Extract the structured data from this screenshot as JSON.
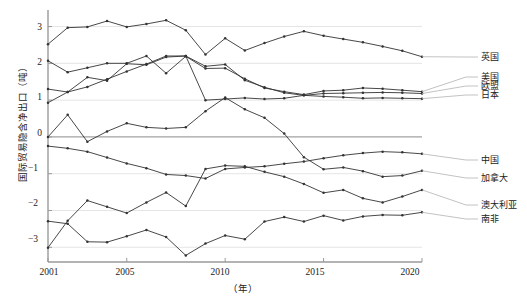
{
  "chart_data": {
    "type": "line",
    "title": "",
    "xlabel": "（年）",
    "ylabel": "国际贸易隐含净出口（吨）",
    "xlim": [
      2001,
      2020
    ],
    "ylim": [
      -3.4,
      3.45
    ],
    "yticks": [
      3,
      2,
      1,
      0,
      -1,
      -2,
      -3
    ],
    "yticklabels": [
      "3",
      "2",
      "1",
      "0",
      "−1",
      "−2",
      "−3"
    ],
    "xticks": [
      2001,
      2005,
      2010,
      2015,
      2020
    ],
    "xticklabels": [
      "2001",
      "2005",
      "2010",
      "2015",
      "2020"
    ],
    "grid": "horizontal",
    "legend_position": "right",
    "x": [
      2001,
      2002,
      2003,
      2004,
      2005,
      2006,
      2007,
      2008,
      2009,
      2010,
      2011,
      2012,
      2013,
      2014,
      2015,
      2016,
      2017,
      2018,
      2019,
      2020
    ],
    "series": [
      {
        "name": "英国",
        "color": "#333333",
        "values": [
          2.52,
          2.97,
          2.99,
          3.15,
          2.99,
          3.07,
          3.17,
          2.9,
          2.24,
          2.68,
          2.35,
          2.55,
          2.73,
          2.87,
          2.75,
          2.66,
          2.57,
          2.46,
          2.34,
          2.18
        ]
      },
      {
        "name": "美国",
        "color": "#333333",
        "values": [
          2.07,
          1.76,
          1.88,
          2.0,
          2.0,
          2.2,
          1.73,
          2.19,
          1.86,
          1.87,
          1.58,
          1.33,
          1.23,
          1.15,
          1.25,
          1.27,
          1.33,
          1.31,
          1.27,
          1.23
        ]
      },
      {
        "name": "欧盟",
        "color": "#333333",
        "values": [
          1.3,
          1.22,
          1.62,
          1.53,
          1.99,
          1.96,
          2.17,
          2.2,
          1.92,
          1.97,
          1.54,
          1.35,
          1.2,
          1.13,
          1.18,
          1.19,
          1.2,
          1.21,
          1.2,
          1.18
        ]
      },
      {
        "name": "日本",
        "color": "#333333",
        "values": [
          0.93,
          1.22,
          1.36,
          1.57,
          1.78,
          1.98,
          2.2,
          2.2,
          1.0,
          1.03,
          1.06,
          1.03,
          1.05,
          1.13,
          1.1,
          1.08,
          1.05,
          1.06,
          1.05,
          1.04
        ]
      },
      {
        "name": "中国",
        "color": "#333333",
        "values": [
          -0.25,
          -0.31,
          -0.4,
          -0.56,
          -0.72,
          -0.85,
          -1.02,
          -1.05,
          -1.13,
          -0.87,
          -0.83,
          -0.8,
          -0.73,
          -0.67,
          -0.58,
          -0.5,
          -0.44,
          -0.4,
          -0.42,
          -0.46
        ]
      },
      {
        "name": "加拿大",
        "color": "#333333",
        "values": [
          0.0,
          0.6,
          -0.13,
          0.15,
          0.37,
          0.26,
          0.23,
          0.26,
          0.7,
          1.07,
          0.75,
          0.52,
          0.09,
          -0.55,
          -0.88,
          -0.83,
          -0.93,
          -1.08,
          -1.05,
          -0.92
        ]
      },
      {
        "name": "澳大利亚",
        "color": "#333333",
        "values": [
          -3.01,
          -2.28,
          -1.73,
          -1.9,
          -2.07,
          -1.78,
          -1.51,
          -1.88,
          -0.87,
          -0.78,
          -0.8,
          -0.95,
          -1.08,
          -1.28,
          -1.52,
          -1.44,
          -1.67,
          -1.78,
          -1.62,
          -1.44
        ]
      },
      {
        "name": "南非",
        "color": "#333333",
        "values": [
          -2.29,
          -2.36,
          -2.85,
          -2.86,
          -2.7,
          -2.53,
          -2.72,
          -3.22,
          -2.9,
          -2.68,
          -2.78,
          -2.3,
          -2.18,
          -2.3,
          -2.14,
          -2.27,
          -2.16,
          -2.12,
          -2.13,
          -2.05
        ]
      }
    ]
  },
  "axis": {
    "yticklabels": [
      "3",
      "2",
      "1",
      "0",
      "−1",
      "−2",
      "−3"
    ],
    "xticklabels": [
      "2001",
      "2005",
      "2010",
      "2015",
      "2020"
    ],
    "ylabel": "国际贸易隐含净出口（吨）",
    "xlabel": "（年）"
  },
  "legend": {
    "items": [
      {
        "label": "英国"
      },
      {
        "label": "美国"
      },
      {
        "label": "欧盟"
      },
      {
        "label": "日本"
      },
      {
        "label": "中国"
      },
      {
        "label": "加拿大"
      },
      {
        "label": "澳大利亚"
      },
      {
        "label": "南非"
      }
    ]
  }
}
